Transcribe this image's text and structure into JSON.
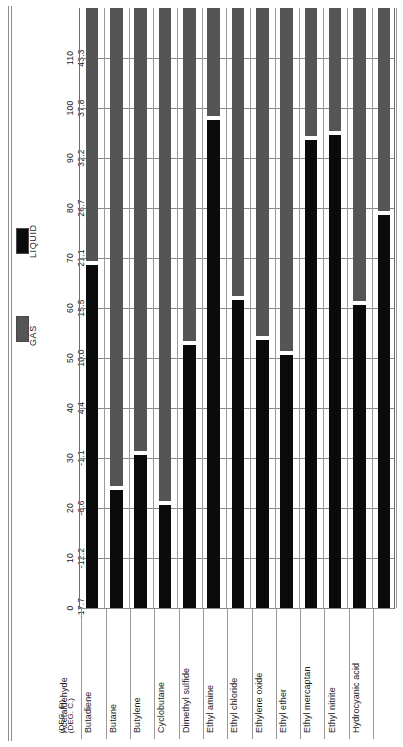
{
  "legend": {
    "items": [
      {
        "key": "liquid",
        "label": "LIQUID",
        "color": "#0b0b0b"
      },
      {
        "key": "gas",
        "label": "GAS",
        "color": "#555555"
      }
    ]
  },
  "axis": {
    "unit_f_label": "(DEG. F.)",
    "unit_c_label": "(DEG. C.)"
  },
  "chart_data": {
    "type": "bar",
    "title": "",
    "subtitle": "",
    "orientation": "vertical-bars-with-rotated-labels",
    "xlabel": "",
    "ylabel_fahrenheit": "(DEG. F.)",
    "ylabel_celsius": "(DEG. C.)",
    "ylim": [
      0,
      118
    ],
    "grid": true,
    "legend_position": "left-gutter",
    "tick_labels_fahrenheit": [
      "0",
      "10",
      "20",
      "30",
      "40",
      "50",
      "60",
      "70",
      "80",
      "90",
      "100",
      "110"
    ],
    "tick_labels_celsius": [
      "-17.7",
      "-12.2",
      "-6.6",
      "-1.1",
      "4.4",
      "10.0",
      "15.5",
      "21.1",
      "26.7",
      "32.2",
      "37.8",
      "43.3"
    ],
    "tick_values_f": [
      0,
      10,
      20,
      30,
      40,
      50,
      60,
      70,
      80,
      90,
      100,
      110
    ],
    "categories": [
      "Acetaldehyde",
      "Butadiene",
      "Butane",
      "Butylene",
      "Cyclobutane",
      "Dimethyl sulfide",
      "Ethyl amine",
      "Ethyl chloride",
      "Ethylene oxide",
      "Ethyl ether",
      "Ethyl mercaptan",
      "Ethyl nitrite",
      "Hydrocyanic acid"
    ],
    "series": [
      {
        "name": "LIQUID",
        "color": "#0b0b0b",
        "description": "Temperature range (deg F) over which substance is liquid",
        "values": [
          69,
          24,
          31,
          21,
          53,
          98,
          62,
          54,
          51,
          94,
          95,
          61,
          79
        ]
      },
      {
        "name": "GAS",
        "color": "#555555",
        "description": "Boiling point (deg F); above this the substance is a gas, bar continues to top of scale",
        "values": [
          118,
          118,
          118,
          118,
          118,
          118,
          118,
          118,
          118,
          118,
          118,
          118,
          118
        ]
      }
    ],
    "boiling_points_f": [
      69,
      24,
      31,
      21,
      53,
      98,
      62,
      54,
      51,
      94,
      95,
      61,
      79
    ],
    "boiling_points_c": [
      20.6,
      -4.4,
      -0.5,
      -6.1,
      11.7,
      36.7,
      16.7,
      12.2,
      10.6,
      34.4,
      35.0,
      16.1,
      26.1
    ]
  }
}
